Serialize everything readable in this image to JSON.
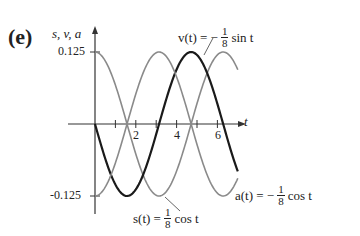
{
  "panel_label": "(e)",
  "chart_data": {
    "type": "line",
    "title": "",
    "xlabel": "t",
    "ylabel": "s, v, a",
    "xlim": [
      0,
      7
    ],
    "ylim": [
      -0.125,
      0.125
    ],
    "x_ticks": [
      1,
      2,
      3,
      4,
      5,
      6
    ],
    "x_tick_labels": [
      "2",
      "4",
      "6"
    ],
    "y_tick_labels": [
      "0.125",
      "-0.125"
    ],
    "grid": false,
    "legend": "inline annotations",
    "x": [
      0,
      0.5,
      1,
      1.5708,
      2,
      2.5,
      3,
      3.1416,
      3.5,
      4,
      4.5,
      4.7124,
      5,
      5.5,
      6,
      6.2832,
      7
    ],
    "series": [
      {
        "name": "s(t) = 1/8 cos t",
        "color": "#8a8a8a",
        "values": [
          0.125,
          0.11,
          0.068,
          0.0,
          -0.052,
          -0.1,
          -0.124,
          -0.125,
          -0.117,
          -0.082,
          -0.026,
          0.0,
          0.035,
          0.089,
          0.12,
          0.125,
          0.094
        ]
      },
      {
        "name": "v(t) = -1/8 sin t",
        "color": "#1a1a1a",
        "values": [
          0.0,
          -0.06,
          -0.105,
          -0.125,
          -0.114,
          -0.075,
          -0.018,
          0.0,
          0.044,
          0.095,
          0.122,
          0.125,
          0.12,
          0.088,
          0.035,
          0.0,
          -0.082
        ]
      },
      {
        "name": "a(t) = -1/8 cos t",
        "color": "#8a8a8a",
        "values": [
          -0.125,
          -0.11,
          -0.068,
          0.0,
          0.052,
          0.1,
          0.124,
          0.125,
          0.117,
          0.082,
          0.026,
          0.0,
          -0.035,
          -0.089,
          -0.12,
          -0.125,
          -0.094
        ]
      }
    ],
    "annotations": {
      "v": {
        "lhs": "v(t) = −",
        "num": "1",
        "den": "8",
        "rhs": "sin t"
      },
      "s": {
        "lhs": "s(t) =",
        "num": "1",
        "den": "8",
        "rhs": "cos t"
      },
      "a": {
        "lhs": "a(t) = −",
        "num": "1",
        "den": "8",
        "rhs": "cos t"
      }
    }
  }
}
